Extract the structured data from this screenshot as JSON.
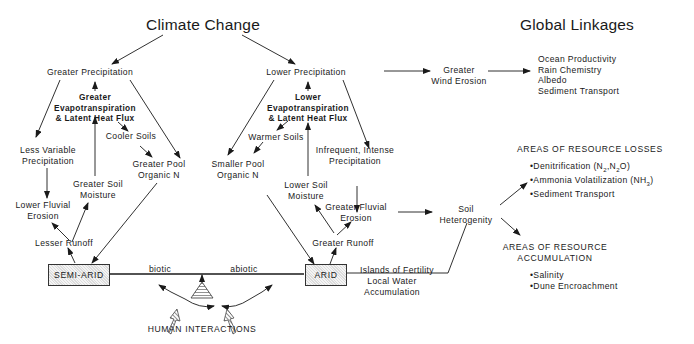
{
  "titles": {
    "climate_change": "Climate Change",
    "global_linkages": "Global Linkages"
  },
  "semi_arid_branch": {
    "greater_precipitation": "Greater Precipitation",
    "evapotranspiration": [
      "Greater",
      "Evapotranspiration",
      "& Latent Heat Flux"
    ],
    "cooler_soils": "Cooler Soils",
    "less_variable_precipitation": [
      "Less Variable",
      "Precipitation"
    ],
    "greater_pool_organic_n": [
      "Greater Pool",
      "Organic N"
    ],
    "greater_soil_moisture": [
      "Greater Soil",
      "Moisture"
    ],
    "lower_fluvial_erosion": [
      "Lower Fluvial",
      "Erosion"
    ],
    "lesser_runoff": "Lesser Runoff",
    "box": "SEMI-ARID"
  },
  "arid_branch": {
    "lower_precipitation": "Lower Precipitation",
    "evapotranspiration": [
      "Lower",
      "Evapotranspiration",
      "& Latent Heat Flux"
    ],
    "warmer_soils": "Warmer Soils",
    "smaller_pool_organic_n": [
      "Smaller Pool",
      "Organic N"
    ],
    "infrequent_precipitation": [
      "Infrequent, Intense",
      "Precipitation"
    ],
    "lower_soil_moisture": [
      "Lower Soil",
      "Moisture"
    ],
    "greater_fluvial_erosion": [
      "Greater Fluvial",
      "Erosion"
    ],
    "greater_runoff": "Greater Runoff",
    "box": "ARID"
  },
  "balance": {
    "biotic": "biotic",
    "abiotic": "abiotic",
    "human_interactions": "HUMAN INTERACTIONS"
  },
  "wind": {
    "greater_wind_erosion": [
      "Greater",
      "Wind Erosion"
    ],
    "global_items": [
      "Ocean Productivity",
      "Rain Chemistry",
      "Albedo",
      "Sediment Transport"
    ]
  },
  "soil": {
    "soil_heterogenity": [
      "Soil",
      "Heterogenity"
    ],
    "islands_of_fertility": "Islands of Fertility",
    "local_water": [
      "Local Water",
      "Accumulation"
    ]
  },
  "resource_losses": {
    "heading": "AREAS OF RESOURCE LOSSES",
    "items": [
      "Denitrification (N2,N2O)",
      "Ammonia Volatilization (NH3)",
      "Sediment Transport"
    ]
  },
  "resource_accumulation": {
    "heading": [
      "AREAS OF RESOURCE",
      "ACCUMULATION"
    ],
    "items": [
      "Salinity",
      "Dune Encroachment"
    ]
  }
}
